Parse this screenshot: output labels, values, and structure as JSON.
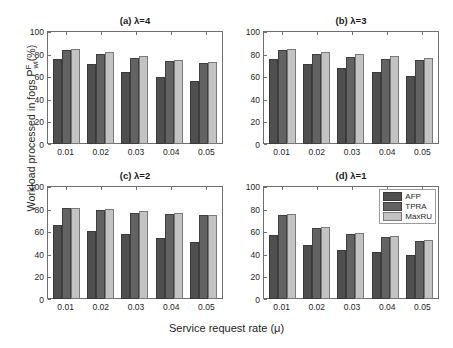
{
  "figure": {
    "xlabel": "Service request rate (μ)",
    "ylabel_parts": {
      "pre": "Workload processed in fogs P",
      "sup": "F",
      "sub": "wl",
      "post": "(%)"
    },
    "ylabel_plain": "Workload processed in fogs P^F_wl (%)"
  },
  "legend": {
    "position": "top-right of subplot (d)",
    "entries": [
      {
        "label": "AFP",
        "color": "#4f4f4f"
      },
      {
        "label": "TPRA",
        "color": "#636363"
      },
      {
        "label": "MaxRU",
        "color": "#c3c3c3"
      }
    ]
  },
  "chart_data": [
    {
      "id": "a",
      "type": "bar",
      "title": "(a)  λ=4",
      "xlabel": "Service request rate (μ)",
      "ylabel": "Workload processed in fogs P^F_wl (%)",
      "categories": [
        "0.01",
        "0.02",
        "0.03",
        "0.04",
        "0.05"
      ],
      "ylim": [
        0,
        100
      ],
      "yticks": [
        0,
        20,
        40,
        60,
        80,
        100
      ],
      "grid": false,
      "series": [
        {
          "name": "AFP",
          "values": [
            75.5,
            70.5,
            63.5,
            59.0,
            55.5
          ]
        },
        {
          "name": "TPRA",
          "values": [
            83.0,
            80.0,
            76.5,
            73.5,
            72.0
          ]
        },
        {
          "name": "MaxRU",
          "values": [
            84.0,
            81.0,
            77.5,
            74.5,
            73.0
          ]
        }
      ]
    },
    {
      "id": "b",
      "type": "bar",
      "title": "(b)  λ=3",
      "xlabel": "Service request rate (μ)",
      "ylabel": "Workload processed in fogs P^F_wl (%)",
      "categories": [
        "0.01",
        "0.02",
        "0.03",
        "0.04",
        "0.05"
      ],
      "ylim": [
        0,
        100
      ],
      "yticks": [
        0,
        20,
        40,
        60,
        80,
        100
      ],
      "grid": false,
      "series": [
        {
          "name": "AFP",
          "values": [
            75.5,
            70.5,
            67.5,
            64.0,
            60.5
          ]
        },
        {
          "name": "TPRA",
          "values": [
            83.0,
            80.0,
            77.0,
            75.5,
            74.5
          ]
        },
        {
          "name": "MaxRU",
          "values": [
            84.5,
            81.0,
            79.5,
            77.5,
            76.0
          ]
        }
      ]
    },
    {
      "id": "c",
      "type": "bar",
      "title": "(c)  λ=2",
      "xlabel": "Service request rate (μ)",
      "ylabel": "Workload processed in fogs P^F_wl (%)",
      "categories": [
        "0.01",
        "0.02",
        "0.03",
        "0.04",
        "0.05"
      ],
      "ylim": [
        0,
        100
      ],
      "yticks": [
        0,
        20,
        40,
        60,
        80,
        100
      ],
      "grid": false,
      "series": [
        {
          "name": "AFP",
          "values": [
            65.5,
            60.5,
            57.5,
            54.0,
            50.5
          ]
        },
        {
          "name": "TPRA",
          "values": [
            80.5,
            79.0,
            76.5,
            75.5,
            74.0
          ]
        },
        {
          "name": "MaxRU",
          "values": [
            80.5,
            79.5,
            77.5,
            76.0,
            74.5
          ]
        }
      ]
    },
    {
      "id": "d",
      "type": "bar",
      "title": "(d)  λ=1",
      "xlabel": "Service request rate (μ)",
      "ylabel": "Workload processed in fogs P^F_wl (%)",
      "categories": [
        "0.01",
        "0.02",
        "0.03",
        "0.04",
        "0.05"
      ],
      "ylim": [
        0,
        100
      ],
      "yticks": [
        0,
        20,
        40,
        60,
        80,
        100
      ],
      "grid": false,
      "series": [
        {
          "name": "AFP",
          "values": [
            56.5,
            48.0,
            43.5,
            41.5,
            39.0
          ]
        },
        {
          "name": "TPRA",
          "values": [
            74.0,
            63.0,
            57.5,
            55.0,
            51.5
          ]
        },
        {
          "name": "MaxRU",
          "values": [
            75.0,
            64.0,
            58.0,
            55.5,
            52.0
          ]
        }
      ]
    }
  ]
}
